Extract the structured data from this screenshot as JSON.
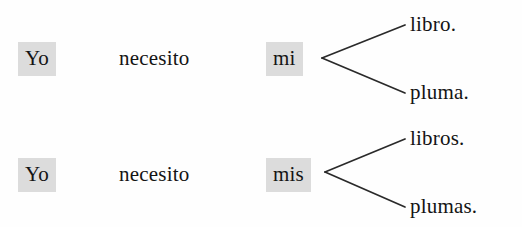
{
  "figure": {
    "type": "grammar-branching-diagram",
    "language": "Spanish",
    "background_color": "#fefefe",
    "text_color": "#141414",
    "highlight_color": "#dcdcdc",
    "line_color": "#2a2a2a"
  },
  "rows": [
    {
      "id": "singular",
      "subject": "Yo",
      "verb": "necesito",
      "possessive": "mi",
      "branches": [
        "libro.",
        "pluma."
      ]
    },
    {
      "id": "plural",
      "subject": "Yo",
      "verb": "necesito",
      "possessive": "mis",
      "branches": [
        "libros.",
        "plumas."
      ]
    }
  ],
  "branch_lines": [
    {
      "name": "row1-branch-upper",
      "x1": 322,
      "y1": 58,
      "x2": 405,
      "y2": 25
    },
    {
      "name": "row1-branch-lower",
      "x1": 322,
      "y1": 58,
      "x2": 405,
      "y2": 93
    },
    {
      "name": "row2-branch-upper",
      "x1": 325,
      "y1": 172,
      "x2": 405,
      "y2": 139
    },
    {
      "name": "row2-branch-lower",
      "x1": 325,
      "y1": 172,
      "x2": 405,
      "y2": 207
    }
  ]
}
